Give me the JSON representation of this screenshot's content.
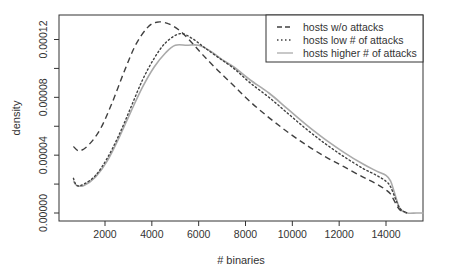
{
  "chart_data": {
    "type": "line",
    "title": "",
    "xlabel": "# binaries",
    "ylabel": "density",
    "xlim": [
      700,
      15600
    ],
    "ylim": [
      0,
      0.000132
    ],
    "x_ticks": [
      2000,
      4000,
      6000,
      8000,
      10000,
      12000,
      14000
    ],
    "y_ticks": [
      0,
      4e-05,
      8e-05,
      0.00012
    ],
    "y_tick_labels": [
      "0.00000",
      "0.00004",
      "0.00008",
      "0.00012"
    ],
    "y_minor_ticks": [
      2e-05,
      6e-05,
      0.0001
    ],
    "grid": false,
    "legend_position": "top-right",
    "series": [
      {
        "name": "hosts w/o attacks",
        "style": "dashed",
        "color": "#404040",
        "x": [
          650,
          900,
          1300,
          1800,
          2300,
          2800,
          3300,
          3800,
          4200,
          4700,
          5200,
          5700,
          6200,
          6800,
          7500,
          8200,
          9000,
          9800,
          10600,
          11400,
          12200,
          13000,
          13600,
          14000,
          14200,
          14400,
          14600,
          14900
        ],
        "values": [
          4.6e-05,
          4.3e-05,
          4.7e-05,
          5.8e-05,
          7.6e-05,
          9.7e-05,
          0.000116,
          0.000128,
          0.000132,
          0.000131,
          0.000126,
          0.000118,
          0.000109,
          9.9e-05,
          8.8e-05,
          7.7e-05,
          6.6e-05,
          5.6e-05,
          4.7e-05,
          3.9e-05,
          3.2e-05,
          2.5e-05,
          2e-05,
          1.6e-05,
          1.3e-05,
          7e-06,
          2e-06,
          0.0
        ]
      },
      {
        "name": "hosts low # of attacks",
        "style": "dotted",
        "color": "#404040",
        "x": [
          650,
          800,
          1100,
          1600,
          2100,
          2600,
          3100,
          3600,
          4100,
          4600,
          5200,
          5700,
          6200,
          6800,
          7500,
          8200,
          9000,
          9800,
          10600,
          11400,
          12200,
          13000,
          13600,
          14000,
          14200,
          14400,
          14600,
          14900
        ],
        "values": [
          2.4e-05,
          1.9e-05,
          2e-05,
          2.6e-05,
          3.8e-05,
          5.4e-05,
          7.3e-05,
          9.2e-05,
          0.000107,
          0.000118,
          0.000124,
          0.000121,
          0.000115,
          0.000108,
          0.0001,
          9e-05,
          8e-05,
          6.9e-05,
          5.8e-05,
          4.8e-05,
          3.9e-05,
          3.1e-05,
          2.6e-05,
          2.2e-05,
          1.8e-05,
          1e-05,
          3e-06,
          0.0
        ]
      },
      {
        "name": "hosts higher # of attacks",
        "style": "solid",
        "color": "#aaaaaa",
        "x": [
          650,
          800,
          1100,
          1600,
          2100,
          2600,
          3100,
          3600,
          4100,
          4600,
          5000,
          5500,
          6000,
          6500,
          7000,
          7500,
          8200,
          9000,
          9800,
          10600,
          11400,
          12200,
          13000,
          13600,
          14000,
          14200,
          14400,
          14600,
          14900,
          15300,
          15600
        ],
        "values": [
          2.2e-05,
          1.9e-05,
          1.9e-05,
          2.5e-05,
          3.6e-05,
          5.2e-05,
          7e-05,
          8.7e-05,
          0.000101,
          0.000111,
          0.000116,
          0.000116,
          0.000116,
          0.000112,
          0.000106,
          0.000101,
          9.2e-05,
          8.3e-05,
          7.2e-05,
          6.1e-05,
          5.1e-05,
          4.2e-05,
          3.4e-05,
          2.9e-05,
          2.6e-05,
          2.2e-05,
          1.2e-05,
          3e-06,
          0.0,
          0.0,
          0.0
        ]
      }
    ]
  },
  "legend": {
    "items": [
      {
        "label": "hosts w/o attacks",
        "style": "dashed"
      },
      {
        "label": "hosts low # of attacks",
        "style": "dotted"
      },
      {
        "label": "hosts higher # of attacks",
        "style": "solid"
      }
    ]
  },
  "axes": {
    "x_label": "# binaries",
    "y_label": "density",
    "x_tick_labels": [
      "2000",
      "4000",
      "6000",
      "8000",
      "10000",
      "12000",
      "14000"
    ],
    "y_tick_labels": [
      "0.00000",
      "0.00004",
      "0.00008",
      "0.00012"
    ]
  }
}
